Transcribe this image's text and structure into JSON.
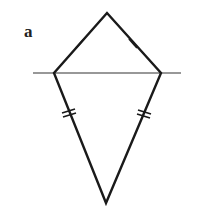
{
  "figure": {
    "label": "a",
    "stroke_color": "#1a1a1a",
    "line_color": "#333333",
    "shape": "kite",
    "vertices": {
      "top": [
        107,
        13
      ],
      "left": [
        54,
        73
      ],
      "right": [
        161,
        73
      ],
      "bottom": [
        106,
        203
      ]
    },
    "horizontal_line": {
      "x1": 33,
      "x2": 181,
      "y": 73
    },
    "tick_marks": {
      "upper_sides": "single",
      "lower_sides": "double"
    }
  }
}
